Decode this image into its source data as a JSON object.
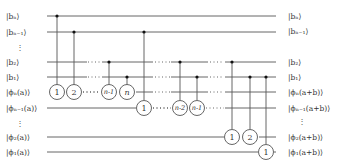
{
  "diagram": {
    "type": "quantum-circuit",
    "left_labels": [
      "|bₙ⟩",
      "|bₙ₋₁⟩",
      "⋮",
      "|b₂⟩",
      "|b₁⟩",
      "|ϕₙ(a)⟩",
      "|ϕₙ₋₁(a)⟩",
      "⋮",
      "|ϕ₂(a)⟩",
      "|ϕ₁(a)⟩"
    ],
    "right_labels": [
      "|bₙ⟩",
      "|bₙ₋₁⟩",
      "⋮",
      "|b₂⟩",
      "|b₁⟩",
      "|ϕₙ(a+b)⟩",
      "|ϕₙ₋₁(a+b)⟩",
      "⋮",
      "|ϕ₂(a+b)⟩",
      "|ϕ₁(a+b)⟩"
    ],
    "gates": [
      {
        "label": "1",
        "target": "phi_n",
        "control": "b_n"
      },
      {
        "label": "2",
        "target": "phi_n",
        "control": "b_n-1"
      },
      {
        "label": "n-1",
        "target": "phi_n",
        "control": "b_2"
      },
      {
        "label": "n",
        "target": "phi_n",
        "control": "b_1"
      },
      {
        "label": "1",
        "target": "phi_n-1",
        "control": "b_n-1"
      },
      {
        "label": "n-2",
        "target": "phi_n-1",
        "control": "b_2"
      },
      {
        "label": "n-1",
        "target": "phi_n-1",
        "control": "b_1"
      },
      {
        "label": "1",
        "target": "phi_2",
        "control": "b_2"
      },
      {
        "label": "2",
        "target": "phi_2",
        "control": "b_1"
      },
      {
        "label": "1",
        "target": "phi_1",
        "control": "b_1"
      }
    ]
  }
}
